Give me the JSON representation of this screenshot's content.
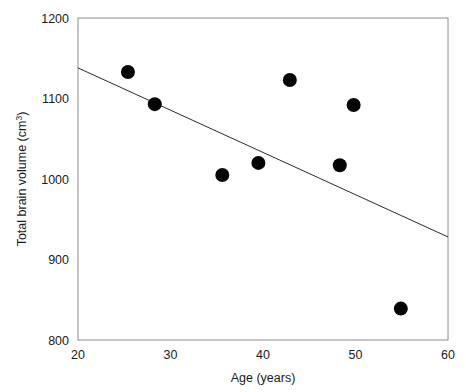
{
  "figure": {
    "background_color": "#ffffff",
    "width": 466,
    "height": 392
  },
  "chart_data": {
    "type": "scatter",
    "title": "",
    "xlabel": "Age (years)",
    "ylabel": "Total brain volume (cm",
    "ylabel_superscript": "3",
    "ylabel_suffix": ")",
    "ylabel_full": "Total brain volume (cm³)",
    "xlim": [
      20,
      60
    ],
    "ylim": [
      800,
      1200
    ],
    "xticks": [
      20,
      30,
      40,
      50,
      60
    ],
    "yticks": [
      800,
      900,
      1000,
      1100,
      1200
    ],
    "xtick_labels": [
      "20",
      "30",
      "40",
      "50",
      "60"
    ],
    "ytick_labels": [
      "800",
      "900",
      "1000",
      "1100",
      "1200"
    ],
    "grid": false,
    "legend": false,
    "legend_position": "none",
    "marker_color": "#050505",
    "marker_shape": "circle",
    "marker_size": 7,
    "frame_color": "#8c8c8c",
    "trendline_color": "#2b2b2b",
    "x": [
      25.4,
      28.3,
      35.6,
      39.5,
      42.9,
      48.3,
      49.8,
      54.9
    ],
    "y": [
      1133,
      1093,
      1005,
      1020,
      1123,
      1017,
      1092,
      839
    ],
    "points": [
      {
        "x": 25.4,
        "y": 1133
      },
      {
        "x": 28.3,
        "y": 1093
      },
      {
        "x": 35.6,
        "y": 1005
      },
      {
        "x": 39.5,
        "y": 1020
      },
      {
        "x": 42.9,
        "y": 1123
      },
      {
        "x": 48.3,
        "y": 1017
      },
      {
        "x": 49.8,
        "y": 1092
      },
      {
        "x": 54.9,
        "y": 839
      }
    ],
    "trendline": {
      "type": "linear",
      "x_start": 20,
      "y_start": 1138,
      "x_end": 60,
      "y_end": 928
    }
  }
}
